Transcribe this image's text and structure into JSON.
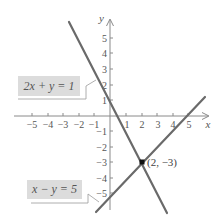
{
  "axes": {
    "x_label": "x",
    "y_label": "y",
    "x_ticks": [
      "−5",
      "−4",
      "−3",
      "−2",
      "−1",
      "1",
      "2",
      "3",
      "4",
      "5"
    ],
    "y_ticks_pos": [
      "1",
      "2",
      "3",
      "4",
      "5"
    ],
    "y_ticks_neg": [
      "−1",
      "−2",
      "−3",
      "−4",
      "−5"
    ]
  },
  "lines": [
    {
      "label": "2x + y = 1",
      "color": "#6a6a6a"
    },
    {
      "label": "x − y = 5",
      "color": "#6a6a6a"
    }
  ],
  "intersection": {
    "label": "(2, −3)",
    "x": 2,
    "y": -3
  },
  "colors": {
    "axis": "#8a8a8a",
    "line": "#6a6a6a",
    "box": "#dcdcdc",
    "text": "#555555"
  }
}
